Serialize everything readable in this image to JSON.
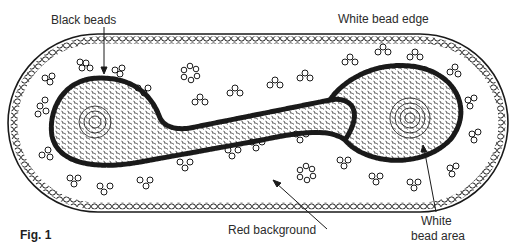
{
  "figure": {
    "caption": "Fig. 1",
    "labels": {
      "black_beads": "Black beads",
      "white_bead_edge": "White bead edge",
      "red_background": "Red background",
      "white_bead_area_line1": "White",
      "white_bead_area_line2": "bead area"
    },
    "colors": {
      "ink": "#1a1a1a",
      "paper": "#ffffff",
      "label_text": "#2b2b2b"
    },
    "floating_clusters": [
      {
        "cx": 190,
        "cy": 73
      },
      {
        "cx": 306,
        "cy": 173
      }
    ]
  }
}
